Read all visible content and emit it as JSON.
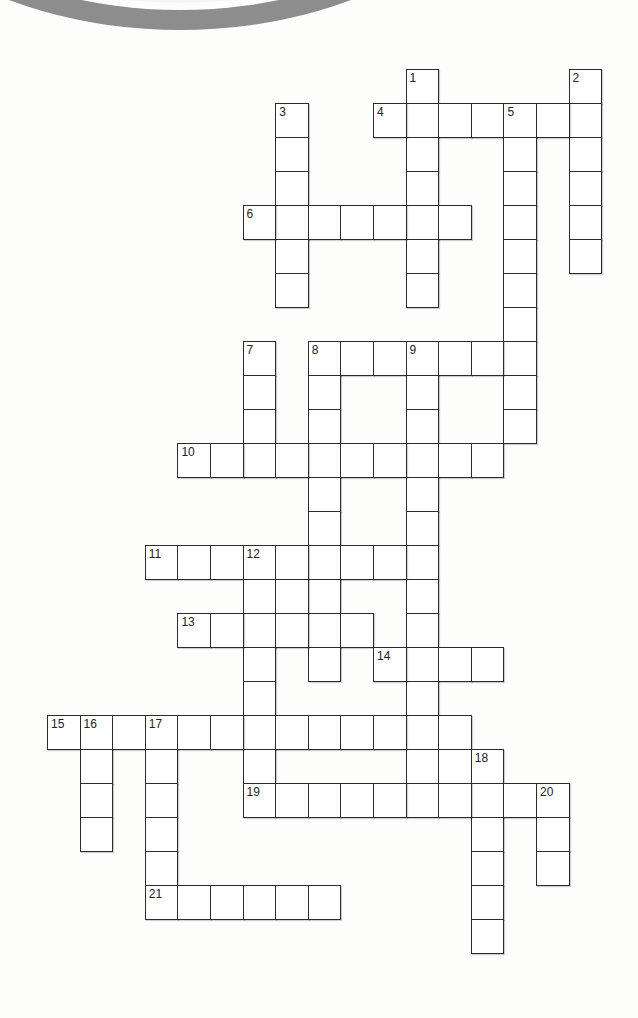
{
  "puzzle": {
    "type": "crossword",
    "cell_width": 32.6,
    "cell_height": 34,
    "origin_x": 47,
    "origin_y": 69,
    "border_color": "#2b2b2b",
    "decoration": "grey-arc-top-left"
  },
  "words": [
    {
      "number": "1",
      "direction": "down",
      "row": 0,
      "col": 11,
      "length": 7
    },
    {
      "number": "2",
      "direction": "down",
      "row": 0,
      "col": 16,
      "length": 6
    },
    {
      "number": "3",
      "direction": "down",
      "row": 1,
      "col": 7,
      "length": 6
    },
    {
      "number": "4",
      "direction": "across",
      "row": 1,
      "col": 10,
      "length": 7
    },
    {
      "number": "5",
      "direction": "down",
      "row": 1,
      "col": 14,
      "length": 10
    },
    {
      "number": "6",
      "direction": "across",
      "row": 4,
      "col": 6,
      "length": 7
    },
    {
      "number": "7",
      "direction": "down",
      "row": 8,
      "col": 6,
      "length": 4
    },
    {
      "number": "8",
      "direction": "across",
      "row": 8,
      "col": 8,
      "length": 7
    },
    {
      "number": "8",
      "direction": "down",
      "row": 8,
      "col": 8,
      "length": 10
    },
    {
      "number": "9",
      "direction": "down",
      "row": 8,
      "col": 11,
      "length": 14
    },
    {
      "number": "10",
      "direction": "across",
      "row": 11,
      "col": 4,
      "length": 10
    },
    {
      "number": "11",
      "direction": "across",
      "row": 14,
      "col": 3,
      "length": 9
    },
    {
      "number": "12",
      "direction": "down",
      "row": 14,
      "col": 6,
      "length": 8
    },
    {
      "number": "",
      "direction": "down",
      "row": 15,
      "col": 7,
      "length": 1
    },
    {
      "number": "13",
      "direction": "across",
      "row": 16,
      "col": 4,
      "length": 6
    },
    {
      "number": "14",
      "direction": "across",
      "row": 17,
      "col": 10,
      "length": 4
    },
    {
      "number": "15",
      "direction": "across",
      "row": 19,
      "col": 0,
      "length": 13
    },
    {
      "number": "16",
      "direction": "down",
      "row": 19,
      "col": 1,
      "length": 4
    },
    {
      "number": "17",
      "direction": "down",
      "row": 19,
      "col": 3,
      "length": 6
    },
    {
      "number": "",
      "direction": "down",
      "row": 20,
      "col": 12,
      "length": 1
    },
    {
      "number": "18",
      "direction": "down",
      "row": 20,
      "col": 13,
      "length": 6
    },
    {
      "number": "19",
      "direction": "across",
      "row": 21,
      "col": 6,
      "length": 10
    },
    {
      "number": "20",
      "direction": "down",
      "row": 21,
      "col": 15,
      "length": 3
    },
    {
      "number": "21",
      "direction": "across",
      "row": 24,
      "col": 3,
      "length": 6
    }
  ]
}
